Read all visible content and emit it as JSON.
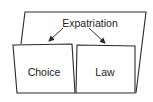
{
  "diagram": {
    "colors": {
      "stroke": "#2a2a2a",
      "background": "#ffffff",
      "text": "#222222"
    },
    "root": {
      "label": "Expatriation",
      "x": 90,
      "y": 23
    },
    "children": [
      {
        "label": "Choice",
        "x": 44,
        "y": 73
      },
      {
        "label": "Law",
        "x": 105,
        "y": 73
      }
    ],
    "edges": [
      {
        "from": "Expatriation",
        "to": "Choice"
      },
      {
        "from": "Expatriation",
        "to": "Law"
      }
    ]
  }
}
